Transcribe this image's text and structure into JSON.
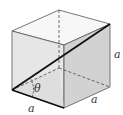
{
  "diagram": {
    "type": "cube-space-diagonal",
    "labels": {
      "edge_front_bottom": "a",
      "edge_right_bottom": "a",
      "edge_right_vertical": "a",
      "angle": "θ"
    },
    "colors": {
      "front_face": "#e6e6e6",
      "right_face": "#d2d2d2",
      "top_face": "#f7f7f7",
      "inner_triangle": "#d9d9d9",
      "edge": "#333333",
      "diagonal": "#111111"
    }
  }
}
